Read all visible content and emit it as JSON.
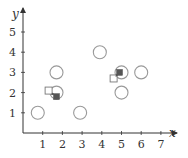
{
  "chart_data": {
    "type": "scatter",
    "title": "",
    "xlabel": "x",
    "ylabel": "y",
    "xlim": [
      0,
      7.5
    ],
    "ylim": [
      0,
      5.7
    ],
    "grid": false,
    "x_ticks": [
      1,
      2,
      3,
      4,
      5,
      6,
      7
    ],
    "y_ticks": [
      1,
      2,
      3,
      4,
      5
    ],
    "series": [
      {
        "name": "circles",
        "marker": "open-circle",
        "points": [
          {
            "x": 0.75,
            "y": 1
          },
          {
            "x": 2.9,
            "y": 1
          },
          {
            "x": 1.7,
            "y": 2
          },
          {
            "x": 1.7,
            "y": 3
          },
          {
            "x": 3.9,
            "y": 4
          },
          {
            "x": 5.0,
            "y": 3
          },
          {
            "x": 6.0,
            "y": 3
          },
          {
            "x": 5.0,
            "y": 2
          }
        ]
      },
      {
        "name": "open-squares",
        "marker": "open-square",
        "points": [
          {
            "x": 1.3,
            "y": 2.1
          },
          {
            "x": 4.6,
            "y": 2.7
          }
        ]
      },
      {
        "name": "filled-squares",
        "marker": "filled-square",
        "points": [
          {
            "x": 1.7,
            "y": 1.8
          },
          {
            "x": 4.9,
            "y": 3.0
          }
        ]
      }
    ],
    "arrows": [
      {
        "from": {
          "x": 1.3,
          "y": 2.1
        },
        "to": {
          "x": 1.7,
          "y": 1.8
        }
      },
      {
        "from": {
          "x": 4.6,
          "y": 2.7
        },
        "to": {
          "x": 4.9,
          "y": 3.0
        }
      }
    ]
  },
  "colors": {
    "axis": "#333333",
    "circle_stroke": "#999999",
    "square_stroke": "#777777",
    "square_fill": "#555555"
  }
}
